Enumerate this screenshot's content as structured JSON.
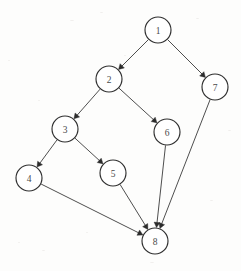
{
  "diagram": {
    "type": "directed-graph",
    "width": 241,
    "height": 271,
    "background_color": "#fdfdfc",
    "node_radius": 13,
    "node_stroke_color": "#2f2f2f",
    "node_fill_color": "#ffffff",
    "edge_color": "#3a3a3a",
    "label_color": "#4a4a4a"
  },
  "nodes": [
    {
      "id": "1",
      "label": "1",
      "x": 158,
      "y": 30
    },
    {
      "id": "2",
      "label": "2",
      "x": 109,
      "y": 79
    },
    {
      "id": "3",
      "label": "3",
      "x": 65,
      "y": 129
    },
    {
      "id": "4",
      "label": "4",
      "x": 29,
      "y": 178
    },
    {
      "id": "5",
      "label": "5",
      "x": 113,
      "y": 173
    },
    {
      "id": "6",
      "label": "6",
      "x": 167,
      "y": 132
    },
    {
      "id": "7",
      "label": "7",
      "x": 215,
      "y": 87
    },
    {
      "id": "8",
      "label": "8",
      "x": 155,
      "y": 241
    }
  ],
  "edges": [
    {
      "from": "1",
      "to": "2",
      "directed": true
    },
    {
      "from": "1",
      "to": "7",
      "directed": true
    },
    {
      "from": "2",
      "to": "3",
      "directed": true
    },
    {
      "from": "2",
      "to": "6",
      "directed": true
    },
    {
      "from": "3",
      "to": "4",
      "directed": true
    },
    {
      "from": "3",
      "to": "5",
      "directed": true
    },
    {
      "from": "4",
      "to": "8",
      "directed": true
    },
    {
      "from": "5",
      "to": "8",
      "directed": true
    },
    {
      "from": "6",
      "to": "8",
      "directed": true
    },
    {
      "from": "7",
      "to": "8",
      "directed": true
    }
  ]
}
